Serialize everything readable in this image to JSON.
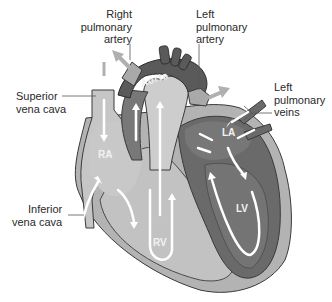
{
  "diagram": {
    "labels": {
      "right_pulmonary_artery": [
        "Right",
        "pulmonary",
        "artery"
      ],
      "left_pulmonary_artery": [
        "Left",
        "pulmonary",
        "artery"
      ],
      "superior_vena_cava": [
        "Superior",
        "vena cava"
      ],
      "left_pulmonary_veins": [
        "Left",
        "pulmonary",
        "veins"
      ],
      "inferior_vena_cava": [
        "Inferior",
        "vena cava"
      ]
    },
    "chambers": {
      "ra": "RA",
      "rv": "RV",
      "la": "LA",
      "lv": "LV"
    },
    "vessel": {
      "aorta": "Aorta"
    },
    "colors": {
      "light_chamber": "#bdbdbd",
      "light_wall": "#a8a8a8",
      "dark_chamber": "#6e6e6e",
      "dark_wall": "#5a5a5a",
      "outline": "#3a3a3a",
      "arrow": "#ffffff",
      "flow_arrow_out": "#b0b0b0"
    }
  }
}
